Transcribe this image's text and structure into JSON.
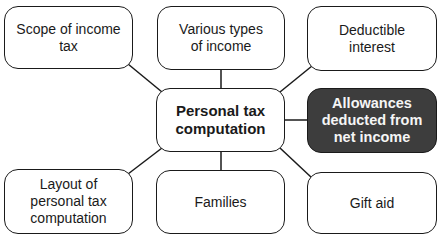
{
  "diagram": {
    "center": {
      "label": "Personal tax computation"
    },
    "nodes": [
      {
        "id": "scope",
        "label": "Scope of income tax"
      },
      {
        "id": "types",
        "label": "Various types of income"
      },
      {
        "id": "interest",
        "label": "Deductible interest"
      },
      {
        "id": "allowances",
        "label": "Allowances deducted from net income",
        "highlighted": true
      },
      {
        "id": "layout",
        "label": "Layout of personal tax computation"
      },
      {
        "id": "families",
        "label": "Families"
      },
      {
        "id": "giftaid",
        "label": "Gift aid"
      }
    ],
    "colors": {
      "highlight_fill": "#3d3d3d",
      "highlight_text": "#f5f5f5",
      "border": "#1a1a1a"
    }
  }
}
